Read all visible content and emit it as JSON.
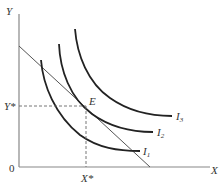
{
  "diagram": {
    "type": "indifference-curve-budget-line",
    "axes": {
      "y_label": "Y",
      "x_label": "X",
      "origin_label": "0"
    },
    "equilibrium": {
      "point_label": "E",
      "y_star_label": "Y*",
      "x_star_label": "X*"
    },
    "curves": [
      {
        "name": "I",
        "subscript": "1"
      },
      {
        "name": "I",
        "subscript": "2"
      },
      {
        "name": "I",
        "subscript": "3"
      }
    ],
    "budget_line": {
      "label": ""
    },
    "colors": {
      "axis": "#888888",
      "curve": "#222222",
      "budget_line": "#555555",
      "dashed": "#666666",
      "text": "#333333"
    }
  }
}
